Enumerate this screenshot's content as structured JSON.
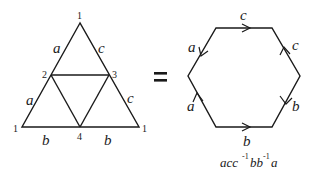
{
  "triangle": {
    "vertices": [
      {
        "id": "apex",
        "label": "1"
      },
      {
        "id": "left-mid",
        "label": "2"
      },
      {
        "id": "right-mid",
        "label": "3"
      },
      {
        "id": "bottom-left",
        "label": "1"
      },
      {
        "id": "bottom-mid",
        "label": "4"
      },
      {
        "id": "bottom-right",
        "label": "1"
      }
    ],
    "edge_labels": {
      "upper_left": "a",
      "lower_left": "a",
      "upper_right": "c",
      "lower_right": "c",
      "bottom_left": "b",
      "bottom_right": "b"
    }
  },
  "equals": "=",
  "hexagon": {
    "edge_labels": {
      "top": "c",
      "upper_right": "c",
      "lower_right": "b",
      "bottom": "b",
      "lower_left": "a",
      "upper_left": "a"
    },
    "word": {
      "parts": [
        "acc",
        "-1",
        "bb",
        "-1",
        "a"
      ],
      "full": "acc⁻¹bb⁻¹a"
    }
  }
}
